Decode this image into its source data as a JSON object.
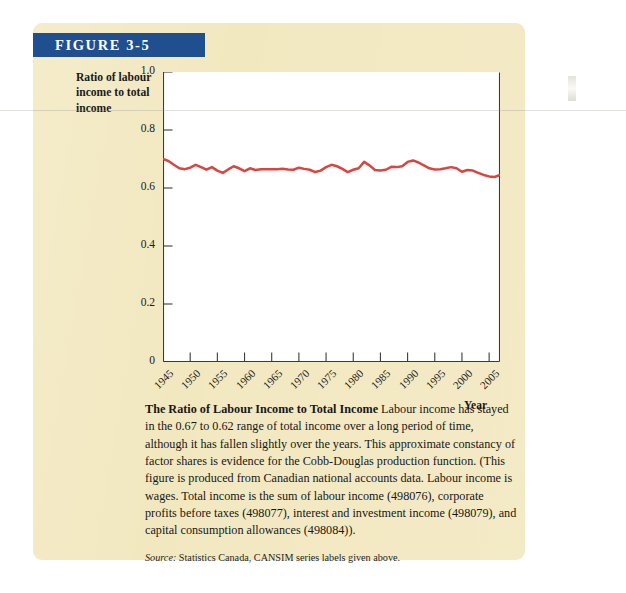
{
  "figure": {
    "banner_label": "FIGURE 3-5",
    "banner_color": "#1f4f8f",
    "panel_color": "#f2e8c0"
  },
  "chart_data": {
    "type": "line",
    "title": "",
    "xlabel": "Year",
    "ylabel": "Ratio of labour income to total income",
    "xlim": [
      1945,
      2007
    ],
    "ylim": [
      0,
      1.0
    ],
    "grid": false,
    "legend": "none",
    "line_color": "#d9453f",
    "y_ticks": [
      "0",
      "0.2",
      "0.4",
      "0.6",
      "0.8",
      "1.0"
    ],
    "y_tick_values": [
      0,
      0.2,
      0.4,
      0.6,
      0.8,
      1.0
    ],
    "x_ticks": [
      "1945",
      "1950",
      "1955",
      "1960",
      "1965",
      "1970",
      "1975",
      "1980",
      "1985",
      "1990",
      "1995",
      "2000",
      "2005"
    ],
    "x_tick_values": [
      1945,
      1950,
      1955,
      1960,
      1965,
      1970,
      1975,
      1980,
      1985,
      1990,
      1995,
      2000,
      2005
    ],
    "series": [
      {
        "name": "Ratio of labour income to total income",
        "x": [
          1945,
          1946,
          1947,
          1948,
          1949,
          1950,
          1951,
          1952,
          1953,
          1954,
          1955,
          1956,
          1957,
          1958,
          1959,
          1960,
          1961,
          1962,
          1963,
          1964,
          1965,
          1966,
          1967,
          1968,
          1969,
          1970,
          1971,
          1972,
          1973,
          1974,
          1975,
          1976,
          1977,
          1978,
          1979,
          1980,
          1981,
          1982,
          1983,
          1984,
          1985,
          1986,
          1987,
          1988,
          1989,
          1990,
          1991,
          1992,
          1993,
          1994,
          1995,
          1996,
          1997,
          1998,
          1999,
          2000,
          2001,
          2002,
          2003,
          2004,
          2005,
          2006,
          2007
        ],
        "values": [
          0.7,
          0.693,
          0.68,
          0.668,
          0.665,
          0.67,
          0.68,
          0.672,
          0.663,
          0.672,
          0.66,
          0.652,
          0.664,
          0.675,
          0.668,
          0.658,
          0.668,
          0.662,
          0.665,
          0.665,
          0.665,
          0.665,
          0.666,
          0.664,
          0.663,
          0.67,
          0.666,
          0.663,
          0.655,
          0.66,
          0.672,
          0.68,
          0.675,
          0.666,
          0.655,
          0.663,
          0.668,
          0.69,
          0.678,
          0.662,
          0.66,
          0.663,
          0.673,
          0.672,
          0.675,
          0.69,
          0.695,
          0.688,
          0.678,
          0.668,
          0.664,
          0.665,
          0.668,
          0.672,
          0.668,
          0.656,
          0.662,
          0.66,
          0.652,
          0.645,
          0.64,
          0.638,
          0.645
        ]
      }
    ]
  },
  "caption": {
    "title": "The Ratio of Labour Income to Total Income",
    "body": "Labour income has stayed in the 0.67 to 0.62 range of total income over a long period of time, although it has fallen slightly over the years. This approximate constancy of factor shares is evidence for the Cobb-Douglas production function. (This figure is produced from Canadian national accounts data. Labour income is wages. Total income is the sum of labour income (498076), corporate profits before taxes (498077), interest and investment income (498079), and capital consumption allowances (498084)).",
    "source_label": "Source:",
    "source_text": "Statistics Canada, CANSIM series labels given above."
  }
}
